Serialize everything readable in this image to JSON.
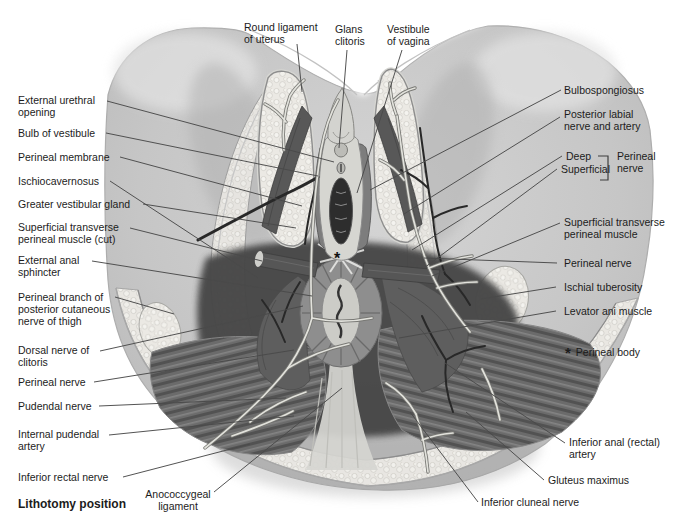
{
  "figure": {
    "caption": "Lithotomy position",
    "type": "anatomical-diagram"
  },
  "legend": {
    "symbol": "*",
    "meaning": "Perineal body"
  },
  "colors": {
    "background": "#ffffff",
    "skin": "#c8c8c8",
    "fat": "#ebe9e4",
    "deep_muscle": "#474747",
    "mid_muscle": "#6b6b6b",
    "nerve": "#e2e2dc",
    "artery": "#282828",
    "label_text": "#1c1c1c",
    "leader_line": "#4a4a4a"
  },
  "labels": [
    {
      "id": "round-ligament-of-uterus",
      "lines": [
        "Round ligament",
        "of uterus"
      ],
      "x": 244,
      "y": 22,
      "leader": [
        297,
        44,
        302,
        92
      ]
    },
    {
      "id": "glans-clitoris",
      "lines": [
        "Glans",
        "clitoris"
      ],
      "x": 335,
      "y": 24,
      "leader": [
        347,
        50,
        339,
        148
      ]
    },
    {
      "id": "vestibule-of-vagina",
      "lines": [
        "Vestibule",
        "of vagina"
      ],
      "x": 387,
      "y": 24,
      "leader": [
        402,
        50,
        357,
        193
      ]
    },
    {
      "id": "external-urethral-opening",
      "lines": [
        "External urethral",
        "opening"
      ],
      "x": 18,
      "y": 95,
      "leader": [
        107,
        101,
        334,
        162
      ]
    },
    {
      "id": "bulb-of-vestibule",
      "lines": [
        "Bulb of vestibule"
      ],
      "x": 18,
      "y": 128,
      "leader": [
        106,
        133,
        318,
        176
      ]
    },
    {
      "id": "perineal-membrane",
      "lines": [
        "Perineal membrane"
      ],
      "x": 18,
      "y": 152,
      "leader": [
        120,
        157,
        302,
        206
      ]
    },
    {
      "id": "ischiocavernosus",
      "lines": [
        "Ischiocavernosus"
      ],
      "x": 18,
      "y": 176,
      "leader": [
        110,
        181,
        258,
        278
      ]
    },
    {
      "id": "greater-vestibular-gland",
      "lines": [
        "Greater vestibular gland"
      ],
      "x": 18,
      "y": 199,
      "leader": [
        143,
        204,
        296,
        228
      ]
    },
    {
      "id": "superficial-transverse-perineal-muscle-cut",
      "lines": [
        "Superficial transverse",
        "perineal muscle (cut)"
      ],
      "x": 18,
      "y": 222,
      "leader": [
        130,
        228,
        262,
        261
      ]
    },
    {
      "id": "external-anal-sphincter",
      "lines": [
        "External anal",
        "sphincter"
      ],
      "x": 18,
      "y": 255,
      "leader": [
        92,
        261,
        312,
        296
      ]
    },
    {
      "id": "perineal-branch-posterior-cutaneous-nerve-of-thigh",
      "lines": [
        "Perineal branch of",
        "posterior cutaneous",
        "nerve of thigh"
      ],
      "x": 18,
      "y": 292,
      "leader": [
        115,
        297,
        174,
        314
      ]
    },
    {
      "id": "dorsal-nerve-of-clitoris",
      "lines": [
        "Dorsal nerve of",
        "clitoris"
      ],
      "x": 18,
      "y": 345,
      "leader": [
        100,
        351,
        303,
        306
      ]
    },
    {
      "id": "perineal-nerve-left",
      "lines": [
        "Perineal nerve"
      ],
      "x": 18,
      "y": 377,
      "leader": [
        94,
        382,
        294,
        350
      ]
    },
    {
      "id": "pudendal-nerve",
      "lines": [
        "Pudendal nerve"
      ],
      "x": 18,
      "y": 401,
      "leader": [
        99,
        406,
        286,
        398
      ]
    },
    {
      "id": "internal-pudendal-artery",
      "lines": [
        "Internal pudendal",
        "artery"
      ],
      "x": 18,
      "y": 429,
      "leader": [
        109,
        435,
        294,
        416
      ]
    },
    {
      "id": "inferior-rectal-nerve",
      "lines": [
        "Inferior rectal nerve"
      ],
      "x": 18,
      "y": 472,
      "leader": [
        123,
        477,
        250,
        444
      ]
    },
    {
      "id": "lithotomy-position-caption",
      "lines": [
        "Lithotomy position"
      ],
      "x": 18,
      "y": 499,
      "bold": true
    },
    {
      "id": "anococcygeal-ligament",
      "lines": [
        "Anococcygeal",
        "ligament"
      ],
      "x": 136,
      "y": 489,
      "w": 84,
      "center": true,
      "leader": [
        214,
        492,
        342,
        388
      ]
    },
    {
      "id": "inferior-cluneal-nerve",
      "lines": [
        "Inferior cluneal nerve"
      ],
      "x": 481,
      "y": 497,
      "leader": [
        478,
        502,
        410,
        412
      ]
    },
    {
      "id": "bulbospongiosus",
      "lines": [
        "Bulbospongiosus"
      ],
      "x": 564,
      "y": 85,
      "leader": [
        561,
        90,
        370,
        190
      ]
    },
    {
      "id": "posterior-labial-nerve-and-artery",
      "lines": [
        "Posterior labial",
        "nerve and artery"
      ],
      "x": 564,
      "y": 109,
      "leader": [
        560,
        117,
        404,
        214
      ]
    },
    {
      "id": "perineal-nerve-deep",
      "lines": [
        "Deep"
      ],
      "x": 566,
      "y": 151,
      "leader": [
        562,
        156,
        412,
        250
      ]
    },
    {
      "id": "perineal-nerve-superficial",
      "lines": [
        "Superficial"
      ],
      "x": 561,
      "y": 164,
      "leader": [
        557,
        169,
        424,
        268
      ]
    },
    {
      "id": "perineal-nerve-bracket-label",
      "lines": [
        "Perineal",
        "nerve"
      ],
      "x": 617,
      "y": 151
    },
    {
      "id": "superficial-transverse-perineal-muscle",
      "lines": [
        "Superficial transverse",
        "perineal muscle"
      ],
      "x": 564,
      "y": 217,
      "leader": [
        560,
        223,
        432,
        276
      ]
    },
    {
      "id": "perineal-nerve-right",
      "lines": [
        "Perineal nerve"
      ],
      "x": 564,
      "y": 258,
      "leader": [
        557,
        263,
        424,
        258
      ]
    },
    {
      "id": "ischial-tuberosity",
      "lines": [
        "Ischial tuberosity"
      ],
      "x": 564,
      "y": 282,
      "leader": [
        556,
        287,
        481,
        299
      ]
    },
    {
      "id": "levator-ani-muscle",
      "lines": [
        "Levator ani muscle"
      ],
      "x": 564,
      "y": 306,
      "leader": [
        556,
        311,
        399,
        338
      ]
    },
    {
      "id": "perineal-body-legend",
      "lines": [
        "Perineal body"
      ],
      "x": 565,
      "y": 347,
      "star": true
    },
    {
      "id": "inferior-anal-rectal-artery",
      "lines": [
        "Inferior anal (rectal)",
        "artery"
      ],
      "x": 569,
      "y": 437,
      "leader": [
        565,
        443,
        445,
        363
      ]
    },
    {
      "id": "gluteus-maximus",
      "lines": [
        "Gluteus maximus"
      ],
      "x": 548,
      "y": 475,
      "leader": [
        544,
        480,
        466,
        412
      ]
    }
  ]
}
